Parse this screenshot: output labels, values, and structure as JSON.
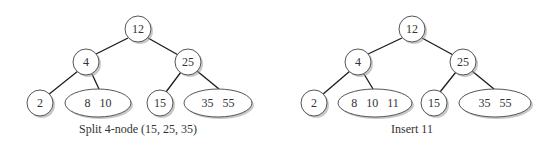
{
  "diagrams": [
    {
      "caption": "Split 4-node (15, 25, 35)",
      "nodes": {
        "root": "12",
        "left": "4",
        "right": "25",
        "ll": "2",
        "lr": "8   10",
        "rl": "15",
        "rr": "35   55"
      }
    },
    {
      "caption": "Insert 11",
      "nodes": {
        "root": "12",
        "left": "4",
        "right": "25",
        "ll": "2",
        "lr": "8   10   11",
        "rl": "15",
        "rr": "35   55"
      }
    }
  ]
}
